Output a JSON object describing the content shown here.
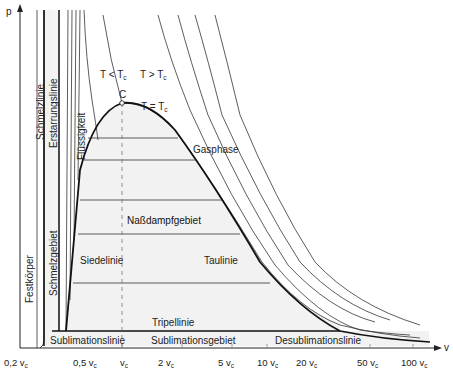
{
  "diagram": {
    "axes": {
      "y_label": "p",
      "x_label": "v",
      "x_ticks": [
        {
          "label": "0,2 v",
          "sub": "c"
        },
        {
          "label": "0,5 v",
          "sub": "c"
        },
        {
          "label": "v",
          "sub": "c"
        },
        {
          "label": "2 v",
          "sub": "c"
        },
        {
          "label": "5 v",
          "sub": "c"
        },
        {
          "label": "10 v",
          "sub": "c"
        },
        {
          "label": "20 v",
          "sub": "c"
        },
        {
          "label": "50 v",
          "sub": "c"
        },
        {
          "label": "100 v",
          "sub": "c"
        }
      ]
    },
    "regions": {
      "festkoerper": "Festkörper",
      "schmelzgebiet": "Schmelzgebiet",
      "fluessigkeit": "Flüssigkeit",
      "nassdampfgebiet": "Naßdampfgebiet",
      "gasphase": "Gasphase",
      "sublimationsgebiet": "Sublimationsgebiet"
    },
    "lines": {
      "schmelzlinie": "Schmelzlinie",
      "erstarrungslinie": "Erstarrungslinie",
      "siedelinie": "Siedelinie",
      "taulinie": "Taulinie",
      "tripellinie": "Tripellinie",
      "sublimationslinie": "Sublimationslinie",
      "desublimationslinie": "Desublimationslinie"
    },
    "isotherms": {
      "below": {
        "text": "T < T",
        "sub": "c"
      },
      "above": {
        "text": "T > T",
        "sub": "c"
      },
      "critical": {
        "text": "T = T",
        "sub": "c"
      }
    },
    "critical_point": "C",
    "colors": {
      "line": "#1a1a1a",
      "thin_line": "#333333",
      "shade": "#f2f2f2",
      "dash": "#777777"
    }
  }
}
